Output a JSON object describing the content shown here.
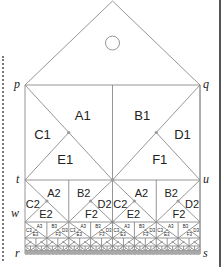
{
  "diagram": {
    "points": {
      "p": "p",
      "q": "q",
      "t": "t",
      "u": "u",
      "w": "w",
      "r": "r",
      "s": "s"
    },
    "roof_circle": "circle",
    "level1": {
      "left": {
        "top": "A1",
        "left": "C1",
        "bottom": "E1"
      },
      "right": {
        "top": "B1",
        "right": "D1",
        "bottom": "F1"
      }
    },
    "level2": [
      {
        "type": "left",
        "top": "A2",
        "left": "C2",
        "bottom": "E2"
      },
      {
        "type": "right",
        "top": "B2",
        "right": "D2",
        "bottom": "F2"
      },
      {
        "type": "left",
        "top": "A2",
        "left": "C2",
        "bottom": "E2"
      },
      {
        "type": "right",
        "top": "B2",
        "right": "D2",
        "bottom": "F2"
      }
    ],
    "level3_labels": {
      "A": "A3",
      "B": "B3",
      "C": "C3",
      "D": "D3",
      "E": "E3",
      "F": "F3"
    }
  },
  "colors": {
    "line": "#8a8a8a",
    "text": "#222222",
    "dot": "#9a9a9a"
  }
}
